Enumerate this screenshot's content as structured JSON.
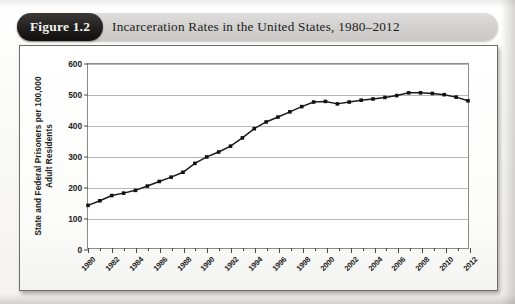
{
  "figure": {
    "badge_label": "Figure 1.2",
    "caption": "Incarceration Rates in the United States, 1980–2012"
  },
  "colors": {
    "badge_background": "#1b1a19",
    "badge_text": "#f2f1ef",
    "header_band": "#d4d3d0",
    "series_line": "#1a1a1a",
    "marker": "#121212",
    "gridline": "#b9b7b4",
    "plot_border": "#8d8b88",
    "card_border": "#6e6c69",
    "plot_background": "#ffffff"
  },
  "chart_data": {
    "type": "line",
    "title": "Incarceration Rates in the United States, 1980–2012",
    "xlabel": "",
    "ylabel": "State and Federal Prisoners per 100,000 Adult Residents",
    "ylabel_lines": [
      "State and Federal Prisoners per 100,000",
      "Adult Residents"
    ],
    "xlim": [
      1980,
      2012
    ],
    "ylim": [
      0,
      600
    ],
    "y_ticks": [
      0,
      100,
      200,
      300,
      400,
      500,
      600
    ],
    "y_tick_labels": [
      "0",
      "100",
      "200",
      "300",
      "400",
      "500",
      "600"
    ],
    "x_major_ticks": [
      1980,
      1982,
      1984,
      1986,
      1988,
      1990,
      1992,
      1994,
      1996,
      1998,
      2000,
      2002,
      2004,
      2006,
      2008,
      2010,
      2012
    ],
    "x_major_tick_labels": [
      "1980",
      "1982",
      "1984",
      "1986",
      "1988",
      "1990",
      "1992",
      "1994",
      "1996",
      "1998",
      "2000",
      "2002",
      "2004",
      "2006",
      "2008",
      "2010",
      "2012"
    ],
    "x_minor_ticks": [
      1981,
      1983,
      1985,
      1987,
      1989,
      1991,
      1993,
      1995,
      1997,
      1999,
      2001,
      2003,
      2005,
      2007,
      2009,
      2011
    ],
    "grid": true,
    "grid_axis": "y",
    "legend": false,
    "legend_position": "none",
    "markers": "square",
    "x": [
      1980,
      1981,
      1982,
      1983,
      1984,
      1985,
      1986,
      1987,
      1988,
      1989,
      1990,
      1991,
      1992,
      1993,
      1994,
      1995,
      1996,
      1997,
      1998,
      1999,
      2000,
      2001,
      2002,
      2003,
      2004,
      2005,
      2006,
      2007,
      2008,
      2009,
      2010,
      2011,
      2012
    ],
    "values": [
      139,
      154,
      171,
      179,
      188,
      202,
      217,
      231,
      247,
      276,
      297,
      313,
      332,
      359,
      389,
      411,
      427,
      444,
      461,
      476,
      478,
      470,
      476,
      482,
      486,
      491,
      497,
      506,
      506,
      504,
      500,
      492,
      480
    ],
    "series": [
      {
        "name": "State and Federal Prisoners per 100,000 Adult Residents",
        "values": [
          139,
          154,
          171,
          179,
          188,
          202,
          217,
          231,
          247,
          276,
          297,
          313,
          332,
          359,
          389,
          411,
          427,
          444,
          461,
          476,
          478,
          470,
          476,
          482,
          486,
          491,
          497,
          506,
          506,
          504,
          500,
          492,
          480
        ]
      }
    ]
  }
}
